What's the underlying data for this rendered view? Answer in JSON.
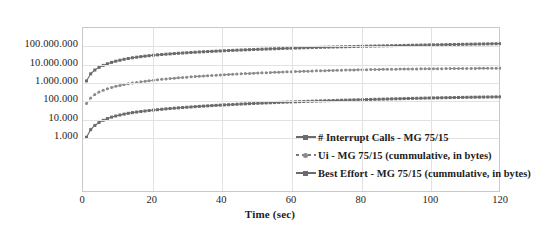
{
  "chart_data": {
    "type": "line",
    "title": "",
    "subtitle": "",
    "xlabel": "Time (sec)",
    "ylabel": "",
    "xlim": [
      0,
      120
    ],
    "ylim": [
      1,
      1000000000
    ],
    "yscale": "log",
    "grid": true,
    "legend_position": "inside-bottom-right",
    "xticks": [
      "0",
      "20",
      "40",
      "60",
      "80",
      "100",
      "120"
    ],
    "xtick_values": [
      0,
      20,
      40,
      60,
      80,
      100,
      120
    ],
    "yticks": [
      "1.000",
      "10.000",
      "100.000",
      "1.000.000",
      "10.000.000",
      "100.000.000"
    ],
    "ytick_values": [
      1000,
      10000,
      100000,
      1000000,
      10000000,
      100000000
    ],
    "series": [
      {
        "name": "# Interrupt Calls - MG 75/15",
        "color": "#6b6b6b",
        "marker": "square",
        "linestyle": "solid",
        "x": [
          1,
          2,
          3,
          4,
          5,
          6,
          7,
          8,
          9,
          10,
          12,
          14,
          16,
          18,
          20,
          22,
          24,
          26,
          28,
          30,
          32,
          34,
          36,
          38,
          40,
          44,
          48,
          52,
          56,
          60,
          64,
          68,
          72,
          76,
          80,
          84,
          88,
          92,
          96,
          100,
          104,
          108,
          112,
          116,
          120
        ],
        "y": [
          1300000,
          2900000,
          4500000,
          6200000,
          7800000,
          9500000,
          11200000,
          13000000,
          14800000,
          16500000,
          20000000,
          23500000,
          26500000,
          29500000,
          32500000,
          35000000,
          37500000,
          40000000,
          42500000,
          45000000,
          47500000,
          50000000,
          52000000,
          54500000,
          57000000,
          61500000,
          66000000,
          70500000,
          75000000,
          79500000,
          84000000,
          88000000,
          92000000,
          96000000,
          100000000,
          104000000,
          108000000,
          112000000,
          116000000,
          120000000,
          124000000,
          128000000,
          132000000,
          136000000,
          140000000
        ]
      },
      {
        "name": "Ui - MG 75/15 (cummulative, in bytes)",
        "color": "#8a8a8a",
        "marker": "circle",
        "linestyle": "dashed",
        "x": [
          1,
          2,
          3,
          4,
          5,
          6,
          7,
          8,
          9,
          10,
          12,
          14,
          16,
          18,
          20,
          22,
          24,
          26,
          28,
          30,
          32,
          34,
          36,
          38,
          40,
          44,
          48,
          52,
          56,
          60,
          64,
          68,
          72,
          76,
          80,
          84,
          88,
          92,
          96,
          100,
          104,
          108,
          112,
          116,
          120
        ],
        "y": [
          75000,
          140000,
          210000,
          280000,
          350000,
          420000,
          490000,
          560000,
          630000,
          700000,
          840000,
          980000,
          1120000,
          1260000,
          1400000,
          1540000,
          1680000,
          1820000,
          1960000,
          2100000,
          2240000,
          2380000,
          2520000,
          2660000,
          2800000,
          3080000,
          3350000,
          3620000,
          3880000,
          4150000,
          4400000,
          4650000,
          4880000,
          5100000,
          5300000,
          5480000,
          5620000,
          5760000,
          5880000,
          5980000,
          6080000,
          6170000,
          6250000,
          6320000,
          6400000
        ]
      },
      {
        "name": "Best Effort - MG 75/15 (cummulative, in bytes)",
        "color": "#6b6b6b",
        "marker": "square",
        "linestyle": "solid",
        "x": [
          1,
          2,
          3,
          4,
          5,
          6,
          7,
          8,
          9,
          10,
          12,
          14,
          16,
          18,
          20,
          22,
          24,
          26,
          28,
          30,
          32,
          34,
          36,
          38,
          40,
          44,
          48,
          52,
          56,
          60,
          64,
          68,
          72,
          76,
          80,
          84,
          88,
          92,
          96,
          100,
          104,
          108,
          112,
          116,
          120
        ],
        "y": [
          1100,
          2600,
          4200,
          6000,
          7800,
          9600,
          11500,
          13400,
          15200,
          17000,
          20500,
          24000,
          27000,
          30000,
          33000,
          36000,
          39000,
          42000,
          45000,
          48000,
          51000,
          54000,
          57000,
          60000,
          63000,
          69000,
          75000,
          81000,
          87000,
          93000,
          99000,
          105000,
          111000,
          117000,
          123000,
          129000,
          135000,
          141000,
          147000,
          153000,
          158000,
          163000,
          168000,
          172000,
          176000
        ]
      }
    ]
  },
  "axis": {
    "x_title": "Time (sec)"
  },
  "legend": {
    "items": [
      {
        "label": "# Interrupt Calls - MG 75/15"
      },
      {
        "label": "Ui - MG 75/15 (cummulative, in bytes)"
      },
      {
        "label": "Best Effort - MG 75/15 (cummulative, in bytes)"
      }
    ]
  },
  "colors": {
    "series_dark": "#6b6b6b",
    "series_mid": "#8a8a8a",
    "grid": "#e2e2e2",
    "frame": "#c9c9c9",
    "text": "#1c1c1c"
  }
}
